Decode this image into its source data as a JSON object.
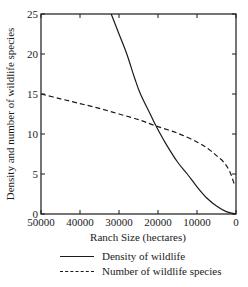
{
  "chart_data": {
    "type": "line",
    "title": "",
    "xlabel": "Ranch Size (hectares)",
    "ylabel": "Density and number of wildlife species",
    "xlim": [
      50000,
      0
    ],
    "ylim": [
      0,
      25
    ],
    "x_reversed": true,
    "xticks": [
      50000,
      40000,
      30000,
      20000,
      10000,
      0
    ],
    "yticks": [
      0,
      5,
      10,
      15,
      20,
      25
    ],
    "grid": false,
    "legend_position": "below",
    "series": [
      {
        "name": "Density of wildlife",
        "style": "solid",
        "x": [
          32000,
          30000,
          28000,
          26000,
          24500,
          22000,
          20500,
          18000,
          15000,
          12500,
          10000,
          7500,
          5000,
          2500,
          0
        ],
        "y": [
          25,
          22.5,
          20,
          17,
          15,
          12.5,
          11,
          8.8,
          6.5,
          5,
          3.4,
          2,
          1,
          0.3,
          0
        ]
      },
      {
        "name": "Number of wildlife species",
        "style": "dashed",
        "x": [
          50000,
          45000,
          40000,
          35000,
          30000,
          25000,
          20500,
          15000,
          10000,
          7000,
          5000,
          3000,
          1500,
          500
        ],
        "y": [
          15,
          14.4,
          13.8,
          13.2,
          12.5,
          11.8,
          11,
          10.1,
          9,
          8.1,
          7.3,
          6.4,
          5.2,
          3.8
        ]
      }
    ],
    "annotations": []
  },
  "legend": {
    "items": [
      {
        "label": "Density of wildlife",
        "style": "solid"
      },
      {
        "label": "Number of wildlife species",
        "style": "dashed"
      }
    ]
  },
  "colors": {
    "line": "#1a1a1a",
    "background": "#ffffff"
  }
}
